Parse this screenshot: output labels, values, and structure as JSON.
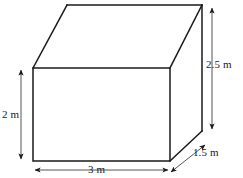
{
  "figure": {
    "name": "rectangular-prism-dimension-diagram",
    "shape": "rectangular prism",
    "unit": "m",
    "stroke_color": "#1a1a1a",
    "fill_color": "#ffffff",
    "background_color": "#ffffff"
  },
  "dimensions": {
    "height_left": {
      "label": "2 m",
      "value": 2,
      "unit": "m",
      "edge": "front-left-vertical"
    },
    "width_bottom": {
      "label": "3 m",
      "value": 3,
      "unit": "m",
      "edge": "front-bottom-horizontal"
    },
    "height_right": {
      "label": "2.5 m",
      "value": 2.5,
      "unit": "m",
      "edge": "back-right-vertical"
    },
    "depth_right": {
      "label": "1.5 m",
      "value": 1.5,
      "unit": "m",
      "edge": "bottom-right-diagonal"
    }
  },
  "geometry": {
    "front_top_left": [
      33,
      68
    ],
    "front_top_right": [
      170,
      68
    ],
    "front_bottom_right": [
      170,
      161
    ],
    "front_bottom_left": [
      33,
      161
    ],
    "back_top_left": [
      67,
      5
    ],
    "back_top_right": [
      202,
      5
    ],
    "back_bottom_right": [
      202,
      131
    ]
  }
}
